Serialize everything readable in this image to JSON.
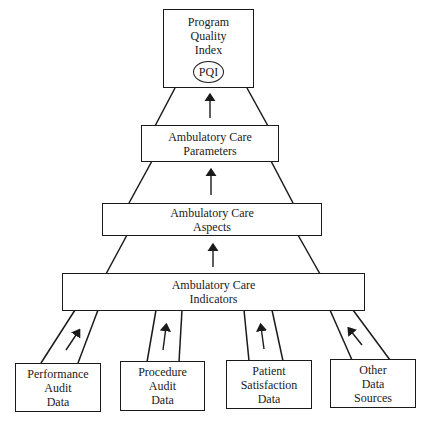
{
  "diagram": {
    "type": "hierarchical-funnel",
    "top": {
      "lines": [
        "Program",
        "Quality",
        "Index"
      ],
      "badge": "PQI"
    },
    "tiers": [
      {
        "id": "parameters",
        "lines": [
          "Ambulatory Care",
          "Parameters"
        ]
      },
      {
        "id": "aspects",
        "lines": [
          "Ambulatory Care",
          "Aspects"
        ]
      },
      {
        "id": "indicators",
        "lines": [
          "Ambulatory Care",
          "Indicators"
        ]
      }
    ],
    "sources": [
      {
        "id": "performance-audit",
        "lines": [
          "Performance",
          "Audit",
          "Data"
        ]
      },
      {
        "id": "procedure-audit",
        "lines": [
          "Procedure",
          "Audit",
          "Data"
        ]
      },
      {
        "id": "patient-satisfaction",
        "lines": [
          "Patient",
          "Satisfaction",
          "Data"
        ]
      },
      {
        "id": "other-sources",
        "lines": [
          "Other",
          "Data",
          "Sources"
        ]
      }
    ],
    "flow_direction": "bottom-to-top",
    "colors": {
      "line": "#1a1a1a",
      "background": "#ffffff"
    }
  }
}
